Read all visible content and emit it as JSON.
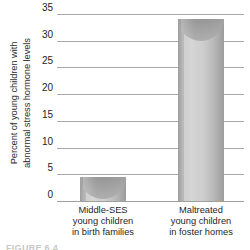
{
  "figure": {
    "caption_partial": "FIGURE 6.4",
    "background_color": "#ffffff",
    "ink_color": "#222222",
    "gridline_color": "#a8a8a8",
    "bar_fill_color": "#c9c9c9",
    "bar_top_color": "#9a9a9a"
  },
  "chart_data": {
    "type": "bar",
    "title": "",
    "subtitle": "",
    "xlabel": "",
    "ylabel": "Percent of young children with abnormal stress hormone levels",
    "ylabel_lines": [
      "Percent of young children with",
      "abnormal stress hormone levels"
    ],
    "categories": [
      "Middle-SES young children in birth families",
      "Maltreated young children in foster homes"
    ],
    "category_lines": [
      [
        "Middle-SES",
        "young children",
        "in birth families"
      ],
      [
        "Maltreated",
        "young children",
        "in foster homes"
      ]
    ],
    "values": [
      4.5,
      34
    ],
    "ylim": [
      0,
      35
    ],
    "yticks": [
      0,
      5,
      10,
      15,
      20,
      25,
      30,
      35
    ],
    "ytick_labels": [
      "0",
      "5",
      "10",
      "15",
      "20",
      "25",
      "30",
      "35"
    ],
    "grid": true,
    "grid_axis": "y",
    "legend": false,
    "legend_position": "none",
    "bar_style": "3d-cylinder"
  }
}
